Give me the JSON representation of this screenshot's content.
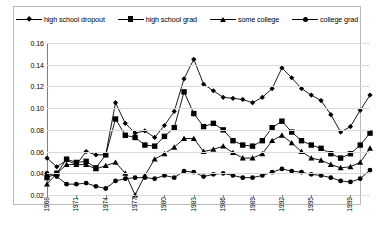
{
  "chart_data": {
    "type": "line",
    "title": "",
    "xlabel": "",
    "ylabel": "",
    "grid": true,
    "legend_position": "top",
    "ylim": [
      0.02,
      0.16
    ],
    "yticks": [
      "0.02",
      "0.04",
      "0.06",
      "0.08",
      "0.10",
      "0.12",
      "0.14",
      "0.16"
    ],
    "ytick_values": [
      0.02,
      0.04,
      0.06,
      0.08,
      0.1,
      0.12,
      0.14,
      0.16
    ],
    "xlim": [
      1968,
      2001
    ],
    "xticks": [
      "1968",
      "1971",
      "1974",
      "1977",
      "1980",
      "1983",
      "1986",
      "1989",
      "1992",
      "1995",
      "1999"
    ],
    "xtick_values": [
      1968,
      1971,
      1974,
      1977,
      1980,
      1983,
      1986,
      1989,
      1992,
      1995,
      1999
    ],
    "x": [
      1968,
      1969,
      1970,
      1971,
      1972,
      1973,
      1974,
      1975,
      1976,
      1977,
      1978,
      1979,
      1980,
      1981,
      1982,
      1983,
      1984,
      1985,
      1986,
      1987,
      1988,
      1989,
      1990,
      1991,
      1992,
      1993,
      1994,
      1995,
      1996,
      1997,
      1998,
      1999,
      2000,
      2001
    ],
    "series": [
      {
        "name": "high school dropout",
        "marker": "diamond",
        "values": [
          0.054,
          0.046,
          0.052,
          0.048,
          0.06,
          0.057,
          0.057,
          0.105,
          0.086,
          0.077,
          0.079,
          0.073,
          0.084,
          0.097,
          0.127,
          0.145,
          0.122,
          0.116,
          0.11,
          0.109,
          0.108,
          0.105,
          0.11,
          0.118,
          0.137,
          0.128,
          0.118,
          0.112,
          0.107,
          0.094,
          0.078,
          0.083,
          0.098,
          0.112
        ]
      },
      {
        "name": "high school grad",
        "marker": "square",
        "values": [
          0.036,
          0.04,
          0.053,
          0.05,
          0.051,
          0.045,
          0.057,
          0.09,
          0.075,
          0.073,
          0.066,
          0.065,
          0.074,
          0.082,
          0.115,
          0.095,
          0.083,
          0.086,
          0.08,
          0.07,
          0.066,
          0.065,
          0.07,
          0.082,
          0.088,
          0.078,
          0.07,
          0.066,
          0.063,
          0.058,
          0.054,
          0.058,
          0.066,
          0.077
        ]
      },
      {
        "name": "some college",
        "marker": "triangle",
        "values": [
          0.03,
          0.04,
          0.048,
          0.048,
          0.048,
          0.044,
          0.047,
          0.05,
          0.04,
          0.02,
          0.038,
          0.053,
          0.058,
          0.064,
          0.072,
          0.072,
          0.06,
          0.062,
          0.065,
          0.059,
          0.054,
          0.054,
          0.058,
          0.07,
          0.075,
          0.068,
          0.06,
          0.054,
          0.052,
          0.048,
          0.045,
          0.046,
          0.05,
          0.063
        ]
      },
      {
        "name": "college grad",
        "marker": "circle",
        "values": [
          0.04,
          0.037,
          0.03,
          0.03,
          0.031,
          0.028,
          0.026,
          0.033,
          0.035,
          0.036,
          0.036,
          0.035,
          0.038,
          0.036,
          0.042,
          0.041,
          0.037,
          0.039,
          0.04,
          0.038,
          0.036,
          0.036,
          0.038,
          0.041,
          0.044,
          0.042,
          0.041,
          0.039,
          0.038,
          0.036,
          0.033,
          0.032,
          0.035,
          0.043
        ]
      }
    ]
  },
  "legend": {
    "items": [
      {
        "label": "high school dropout",
        "marker": "diamond"
      },
      {
        "label": "high school grad",
        "marker": "square"
      },
      {
        "label": "some college",
        "marker": "triangle"
      },
      {
        "label": "college grad",
        "marker": "circle"
      }
    ]
  },
  "colors": {
    "series": "#000000",
    "grid": "#d9d9d9",
    "axis": "#808080",
    "background": "#ffffff",
    "border": "#b9b9b9"
  }
}
